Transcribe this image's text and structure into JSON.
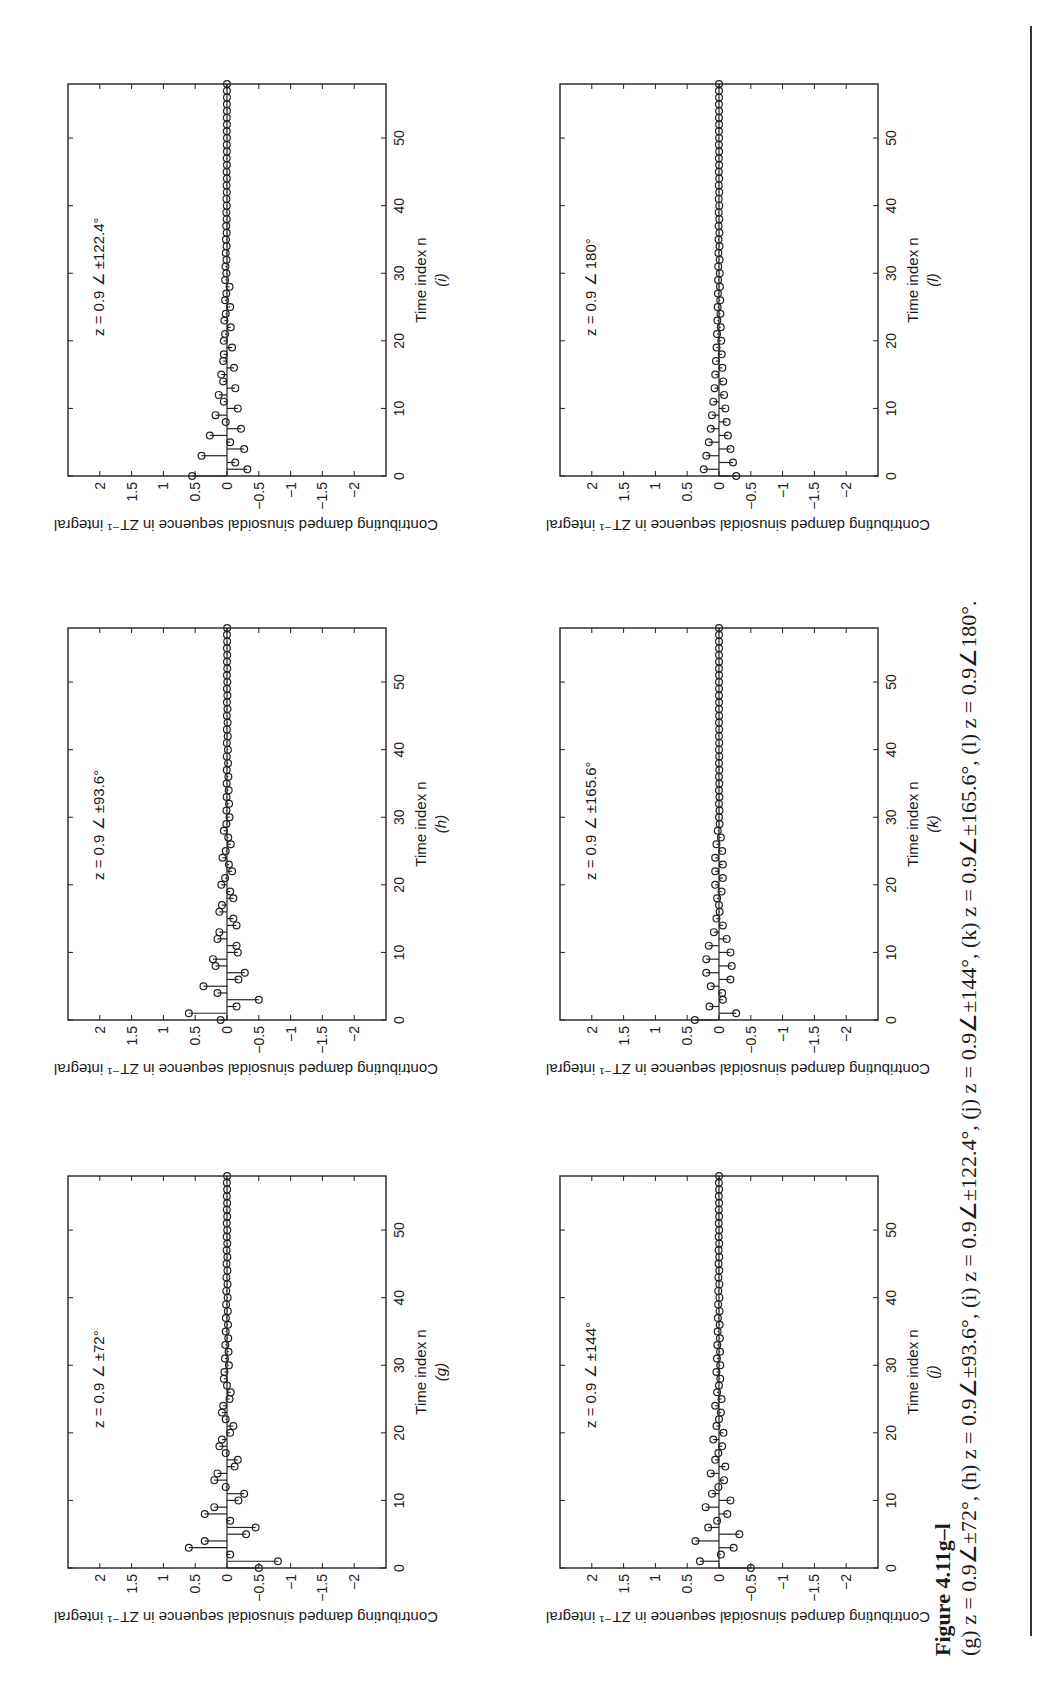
{
  "figure": {
    "label": "Figure 4.11g–l",
    "caption": "(g) z = 0.9∠±72°,   (h) z = 0.9∠±93.6°,   (i) z = 0.9∠±122.4°,   (j) z = 0.9∠±144°,   (k) z = 0.9∠±165.6°,   (l) z = 0.9∠180°."
  },
  "axes_common": {
    "ylabel": "Contributing damped sinusoidal sequence in ZT⁻¹ integral",
    "xlabel": "Time index n",
    "yticks": [
      "2",
      "1.5",
      "1",
      "0.5",
      "0",
      "−0.5",
      "−1",
      "−1.5",
      "−2"
    ],
    "xticks": [
      "0",
      "10",
      "20",
      "30",
      "40",
      "50"
    ]
  },
  "chart_data": [
    {
      "type": "stem",
      "panel": "(g)",
      "title": "",
      "annotation": "z = 0.9 ∠ ±72°",
      "xlabel": "Time index n",
      "ylabel": "Contributing damped sinusoidal sequence in ZT⁻¹ integral",
      "xlim": [
        0,
        58
      ],
      "ylim": [
        -2.5,
        2.5
      ],
      "x": [
        0,
        1,
        2,
        3,
        4,
        5,
        6,
        7,
        8,
        9,
        10,
        11,
        12,
        13,
        14,
        15,
        16,
        17,
        18,
        19,
        20,
        21,
        22,
        23,
        24,
        25,
        26,
        27,
        28,
        29,
        30
      ],
      "values": [
        -0.5,
        -0.8,
        -0.05,
        0.6,
        0.35,
        -0.3,
        -0.45,
        -0.05,
        0.35,
        0.2,
        -0.18,
        -0.27,
        0.02,
        0.2,
        0.15,
        -0.12,
        -0.17,
        0.02,
        0.12,
        0.08,
        -0.05,
        -0.1,
        0.02,
        0.08,
        0.06,
        -0.04,
        -0.06,
        0.0,
        0.05,
        0.04,
        -0.03
      ],
      "grid": false
    },
    {
      "type": "stem",
      "panel": "(h)",
      "annotation": "z = 0.9 ∠ ±93.6°",
      "xlabel": "Time index n",
      "ylabel": "Contributing damped sinusoidal sequence in ZT⁻¹ integral",
      "xlim": [
        0,
        58
      ],
      "ylim": [
        -2.5,
        2.5
      ],
      "x": [
        0,
        1,
        2,
        3,
        4,
        5,
        6,
        7,
        8,
        9,
        10,
        11,
        12,
        13,
        14,
        15,
        16,
        17,
        18,
        19,
        20,
        21,
        22,
        23,
        24,
        25,
        26,
        27,
        28,
        29,
        30
      ],
      "values": [
        0.1,
        0.6,
        -0.15,
        -0.5,
        0.15,
        0.37,
        -0.18,
        -0.28,
        0.18,
        0.22,
        -0.17,
        -0.15,
        0.15,
        0.12,
        -0.15,
        -0.1,
        0.12,
        0.08,
        -0.1,
        -0.05,
        0.09,
        0.03,
        -0.08,
        -0.03,
        0.07,
        0.02,
        -0.06,
        -0.02,
        0.05,
        0.01,
        -0.04
      ],
      "grid": false
    },
    {
      "type": "stem",
      "panel": "(i)",
      "annotation": "z = 0.9 ∠ ±122.4°",
      "xlabel": "Time index n",
      "ylabel": "Contributing damped sinusoidal sequence in ZT⁻¹ integral",
      "xlim": [
        0,
        58
      ],
      "ylim": [
        -2.5,
        2.5
      ],
      "x": [
        0,
        1,
        2,
        3,
        4,
        5,
        6,
        7,
        8,
        9,
        10,
        11,
        12,
        13,
        14,
        15,
        16,
        17,
        18,
        19,
        20,
        21,
        22,
        23,
        24,
        25,
        26,
        27,
        28,
        29,
        30
      ],
      "values": [
        0.55,
        -0.32,
        -0.13,
        0.4,
        -0.27,
        -0.05,
        0.27,
        -0.22,
        0.02,
        0.18,
        -0.17,
        0.05,
        0.13,
        -0.13,
        0.06,
        0.09,
        -0.11,
        0.06,
        0.05,
        -0.08,
        0.05,
        0.03,
        -0.06,
        0.04,
        0.02,
        -0.05,
        0.03,
        0.01,
        -0.04,
        0.03,
        0.01
      ],
      "grid": false
    },
    {
      "type": "stem",
      "panel": "(j)",
      "annotation": "z = 0.9 ∠ ±144°",
      "xlabel": "Time index n",
      "ylabel": "Contributing damped sinusoidal sequence in ZT⁻¹ integral",
      "xlim": [
        0,
        58
      ],
      "ylim": [
        -2.5,
        2.5
      ],
      "x": [
        0,
        1,
        2,
        3,
        4,
        5,
        6,
        7,
        8,
        9,
        10,
        11,
        12,
        13,
        14,
        15,
        16,
        17,
        18,
        19,
        20,
        21,
        22,
        23,
        24,
        25,
        26,
        27,
        28,
        29,
        30
      ],
      "values": [
        -0.5,
        0.3,
        -0.03,
        -0.23,
        0.37,
        -0.32,
        0.17,
        0.03,
        -0.13,
        0.21,
        -0.18,
        0.11,
        0.01,
        -0.08,
        0.13,
        -0.1,
        0.06,
        0.01,
        -0.05,
        0.09,
        -0.07,
        0.04,
        0.0,
        -0.03,
        0.06,
        -0.04,
        0.03,
        0.0,
        -0.02,
        0.04,
        -0.02
      ],
      "grid": false
    },
    {
      "type": "stem",
      "panel": "(k)",
      "annotation": "z = 0.9 ∠ ±165.6°",
      "xlabel": "Time index n",
      "ylabel": "Contributing damped sinusoidal sequence in ZT⁻¹ integral",
      "xlim": [
        0,
        58
      ],
      "ylim": [
        -2.5,
        2.5
      ],
      "x": [
        0,
        1,
        2,
        3,
        4,
        5,
        6,
        7,
        8,
        9,
        10,
        11,
        12,
        13,
        14,
        15,
        16,
        17,
        18,
        19,
        20,
        21,
        22,
        23,
        24,
        25,
        26,
        27,
        28,
        29,
        30
      ],
      "values": [
        0.38,
        -0.27,
        0.15,
        -0.06,
        -0.05,
        0.13,
        -0.18,
        0.2,
        -0.2,
        0.2,
        -0.18,
        0.16,
        -0.12,
        0.08,
        -0.06,
        0.04,
        -0.01,
        0.0,
        0.03,
        -0.04,
        0.06,
        -0.06,
        0.06,
        -0.06,
        0.06,
        -0.05,
        0.04,
        -0.03,
        0.02,
        -0.01,
        0.0
      ],
      "grid": false
    },
    {
      "type": "stem",
      "panel": "(l)",
      "annotation": "z = 0.9 ∠ 180°",
      "xlabel": "Time index n",
      "ylabel": "Contributing damped sinusoidal sequence in ZT⁻¹ integral",
      "xlim": [
        0,
        58
      ],
      "ylim": [
        -2.5,
        2.5
      ],
      "x": [
        0,
        1,
        2,
        3,
        4,
        5,
        6,
        7,
        8,
        9,
        10,
        11,
        12,
        13,
        14,
        15,
        16,
        17,
        18,
        19,
        20,
        21,
        22,
        23,
        24,
        25,
        26,
        27,
        28,
        29,
        30
      ],
      "values": [
        -0.27,
        0.24,
        -0.22,
        0.2,
        -0.18,
        0.16,
        -0.14,
        0.13,
        -0.12,
        0.11,
        -0.1,
        0.09,
        -0.08,
        0.07,
        -0.066,
        0.059,
        -0.053,
        0.048,
        -0.043,
        0.039,
        -0.035,
        0.031,
        -0.028,
        0.025,
        -0.023,
        0.021,
        -0.019,
        0.017,
        -0.015,
        0.014,
        -0.012
      ],
      "grid": false
    }
  ]
}
